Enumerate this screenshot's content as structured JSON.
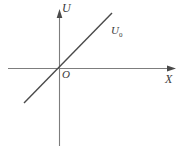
{
  "figure": {
    "title": "",
    "background_color": "#ffffff",
    "axis_color": "#7d7d7d",
    "line_color": "#4a4a4a",
    "text_color": "#3a3a3a"
  },
  "labels": {
    "y_axis": "U",
    "x_axis": "X",
    "origin": "O",
    "line_base": "U",
    "line_subscript": "0"
  },
  "chart_data": {
    "type": "line",
    "title": "",
    "xlabel": "X",
    "ylabel": "U",
    "grid": false,
    "legend": null,
    "origin_label": "O",
    "axes": {
      "x_axis_y_px": 68,
      "y_axis_x_px": 59,
      "x_axis_start_px": 8,
      "x_axis_end_px": 176,
      "y_axis_start_px": 10,
      "y_axis_end_px": 146,
      "x_arrow": "right",
      "y_arrow": "up"
    },
    "series": [
      {
        "name": "U0",
        "label": "U₀",
        "through_origin": true,
        "slope": 1.0,
        "intercept": 0,
        "x": [
          -35,
          53
        ],
        "y": [
          -35,
          55
        ],
        "endpoints_px": [
          [
            24,
            103
          ],
          [
            112,
            13
          ]
        ]
      }
    ],
    "annotations": [
      {
        "text": "U₀",
        "x_px": 111,
        "y_px": 25
      },
      {
        "text": "O",
        "x_px": 62,
        "y_px": 69
      }
    ]
  }
}
